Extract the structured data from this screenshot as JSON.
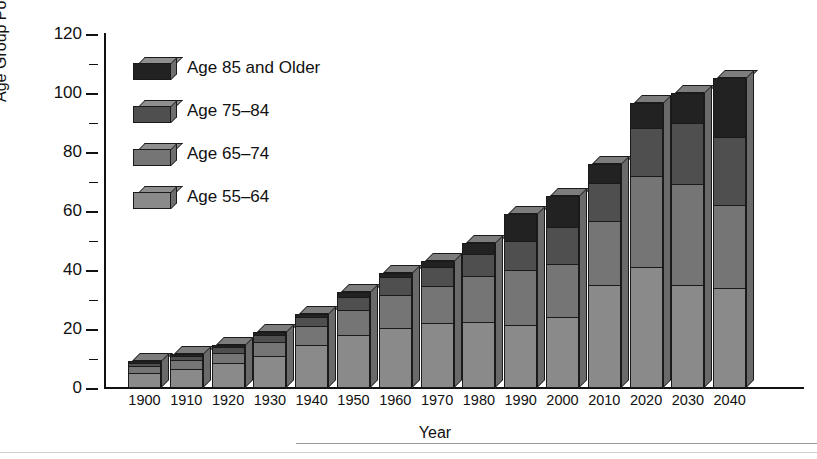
{
  "chart_data": {
    "type": "bar",
    "stacked": true,
    "title": "",
    "xlabel": "Year",
    "ylabel": "Age Group Population (millions)",
    "ylim": [
      0,
      120
    ],
    "ytick_values": [
      0,
      20,
      40,
      60,
      80,
      100,
      120
    ],
    "ytick_labels": [
      "0",
      "20",
      "40",
      "60",
      "80",
      "100",
      "120"
    ],
    "yminor_step": 10,
    "grid": false,
    "legend_position": "upper-left-inside",
    "categories": [
      "1900",
      "1910",
      "1920",
      "1930",
      "1940",
      "1950",
      "1960",
      "1970",
      "1980",
      "1990",
      "2000",
      "2010",
      "2020",
      "2030",
      "2040"
    ],
    "series": [
      {
        "name": "Age 55-64",
        "label": "Age 55–64",
        "color": "#8a8a8a",
        "values": [
          5.0,
          6.5,
          8.5,
          11.0,
          14.5,
          18.0,
          20.5,
          22.0,
          22.5,
          21.5,
          24.0,
          35.0,
          41.0,
          35.0,
          34.0
        ]
      },
      {
        "name": "Age 65-74",
        "label": "Age 65–74",
        "color": "#757575",
        "values": [
          2.5,
          3.0,
          3.5,
          4.5,
          6.5,
          8.5,
          11.0,
          12.5,
          15.5,
          18.5,
          18.0,
          21.5,
          31.0,
          34.0,
          28.0
        ]
      },
      {
        "name": "Age 75-84",
        "label": "Age 75–84",
        "color": "#4f4f4f",
        "values": [
          1.0,
          1.5,
          2.0,
          2.5,
          3.0,
          4.5,
          6.0,
          6.5,
          7.5,
          10.0,
          12.5,
          13.0,
          16.0,
          21.0,
          23.0
        ]
      },
      {
        "name": "Age 85 and Older",
        "label": "Age 85 and Older",
        "color": "#222222",
        "values": [
          0.5,
          0.5,
          0.5,
          1.0,
          1.0,
          1.5,
          1.5,
          2.0,
          3.5,
          9.0,
          10.5,
          6.5,
          8.5,
          10.0,
          20.0
        ]
      }
    ],
    "totals": [
      9.0,
      11.5,
      14.5,
      19.0,
      25.0,
      32.5,
      39.0,
      43.0,
      49.0,
      59.0,
      65.0,
      76.0,
      96.5,
      100.0,
      105.0
    ]
  }
}
